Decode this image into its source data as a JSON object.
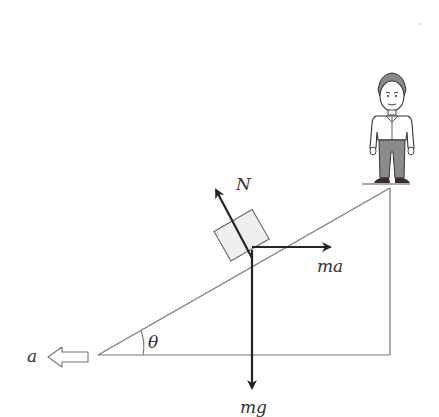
{
  "diagram": {
    "type": "physics-free-body-diagram",
    "labels": {
      "normal_force": "N",
      "pseudo_force": "ma",
      "gravity": "mg",
      "acceleration": "a",
      "angle": "θ"
    },
    "colors": {
      "line": "#777777",
      "arrow": "#2a2222",
      "block_fill": "#efefef",
      "person_pants": "#8a8a8a",
      "person_shoes": "#3a2a2a"
    }
  }
}
